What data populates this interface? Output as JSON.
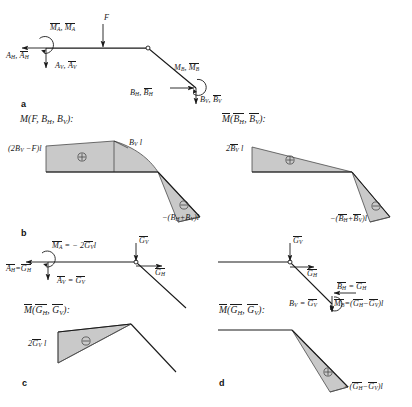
{
  "figure": {
    "panels": [
      "a",
      "b",
      "c",
      "d"
    ]
  },
  "panel_letters": {
    "a": "a",
    "b": "b",
    "c": "c",
    "d": "d"
  },
  "panel_a": {
    "name": "free-body-diagram-real-system",
    "labels": {
      "moment_a": "M",
      "moment_a_sub": "A",
      "moment_a_bar": "M",
      "moment_a_bar_sub": "A",
      "force_f": "F",
      "a_h": "A",
      "a_h_sub": "H",
      "a_h_bar": "A",
      "a_h_bar_sub": "H",
      "a_v": "A",
      "a_v_sub": "V",
      "a_v_bar": "A",
      "a_v_bar_sub": "V",
      "moment_b": "M",
      "moment_b_sub": "B",
      "moment_b_bar": "M",
      "moment_b_bar_sub": "B",
      "b_h": "B",
      "b_h_sub": "H",
      "b_h_bar": "B",
      "b_h_bar_sub": "H",
      "b_v": "B",
      "b_v_sub": "V",
      "b_v_bar": "B",
      "b_v_bar_sub": "V",
      "comma": ", "
    }
  },
  "panel_b_left": {
    "name": "moment-diagram-M",
    "heading": "M(F, B_H, B_V):",
    "left_value": "(2B_V − F)l",
    "mid_value": "B_V l",
    "right_value": "−(B_H + B_V)l",
    "sign_upper": "⊕",
    "sign_lower": "⊖"
  },
  "panel_b_right": {
    "name": "moment-diagram-M-bar",
    "heading": "M̄(B̄_H, B̄_V):",
    "left_value": "2B̄_V l",
    "right_value": "−(B̄_H + B̄_V)l",
    "sign_upper": "⊕",
    "sign_lower": "⊖"
  },
  "panel_c": {
    "name": "virtual-system-G",
    "moment_a": "M̄_A = − 2Ḡ_V l",
    "a_h": "Ā_H = Ḡ_H",
    "a_v": "Ā_V = Ḡ_V",
    "g_v": "Ḡ_V",
    "g_h": "Ḡ_H",
    "heading": "M̄(Ḡ_H, Ḡ_V):",
    "value": "2Ḡ_V l",
    "sign": "⊖"
  },
  "panel_d": {
    "name": "virtual-system-G-right",
    "g_v": "Ḡ_V",
    "g_h": "Ḡ_H",
    "b_h": "B̄_H = Ḡ_H",
    "b_v": "B̄_V = Ḡ_V",
    "moment_b": "M̄_B = (Ḡ_H − Ḡ_V)l",
    "heading": "M̄(Ḡ_H, Ḡ_V):",
    "value": "−(Ḡ_H − Ḡ_V)l",
    "sign": "⊕"
  },
  "colors": {
    "line": "#1a1a1a",
    "fill": "#c9c9c9",
    "fill_stroke": "#4a4a4a",
    "background": "#ffffff"
  }
}
